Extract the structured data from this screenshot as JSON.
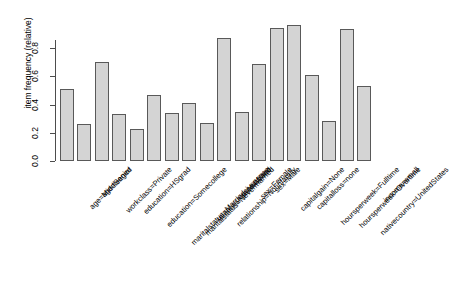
{
  "chart_data": {
    "type": "bar",
    "title": "",
    "xlabel": "",
    "ylabel": "item frequency (relative)",
    "ylim": [
      0,
      1.0
    ],
    "yticks": [
      "0.0",
      "0.2",
      "0.4",
      "0.6",
      "0.8"
    ],
    "ytick_values": [
      0.0,
      0.2,
      0.4,
      0.6,
      0.8
    ],
    "grid": false,
    "legend": null,
    "orientation": "vertical",
    "bar_fill_color": "#d4d4d4",
    "bar_border_color": "#595959",
    "categories": [
      "age=Middleaged",
      "age=Senior",
      "workclass=Private",
      "education=HSgrad",
      "education=Somecollege",
      "maritalstatus=Marriedcivspouse",
      "maritalstatus=Nevermarried",
      "relationship=Husband",
      "relationship=Notinfamily",
      "race=White",
      "sex=Female",
      "sex=Male",
      "capitalgain=None",
      "capitalloss=none",
      "hoursperweek=Fulltime",
      "hoursperweek=Overtime",
      "nativecountry=UnitedStates",
      "income=small"
    ],
    "values": [
      0.51,
      0.265,
      0.7,
      0.33,
      0.23,
      0.47,
      0.34,
      0.415,
      0.27,
      0.875,
      0.35,
      0.685,
      0.945,
      0.965,
      0.61,
      0.285,
      0.935,
      0.535
    ]
  }
}
